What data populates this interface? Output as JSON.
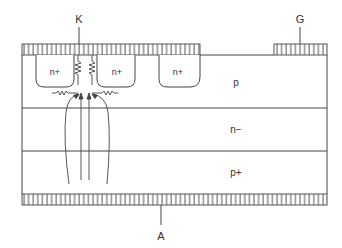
{
  "diagram": {
    "terminals": {
      "cathode": "K",
      "gate": "G",
      "anode": "A"
    },
    "regions": {
      "n_plus_1": "n+",
      "n_plus_2": "n+",
      "n_plus_3": "n+",
      "p_base": "p",
      "n_base": "n−",
      "p_emitter": "p+"
    },
    "colors": {
      "line": "#444444",
      "text": "#333333",
      "background": "#ffffff"
    }
  }
}
